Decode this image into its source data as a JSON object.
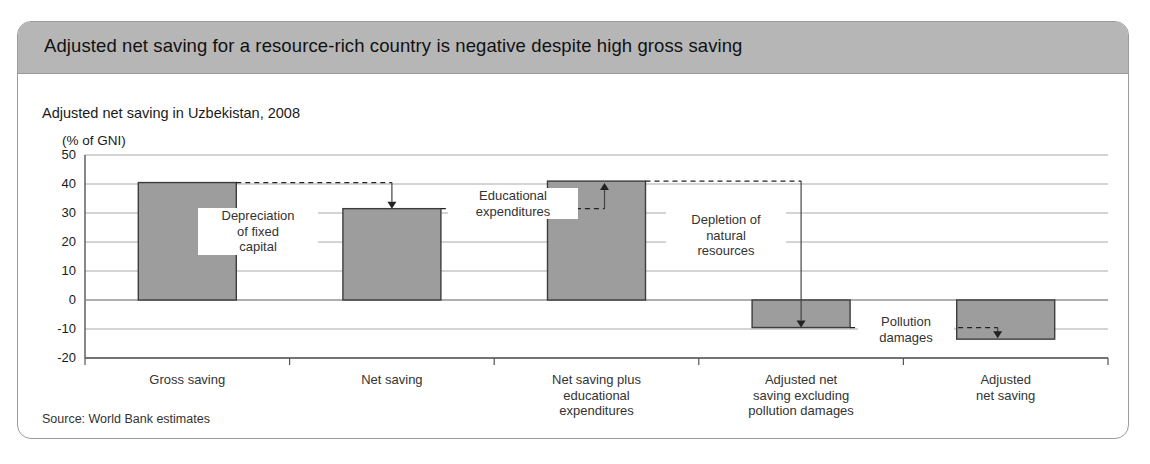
{
  "header": {
    "title": "Adjusted net saving for a resource-rich country is negative despite high gross saving"
  },
  "source": {
    "text": "Source: World Bank estimates"
  },
  "chart_data": {
    "type": "bar",
    "title": "Adjusted net saving in Uzbekistan, 2008",
    "unit_label": "(% of GNI)",
    "xlabel": "",
    "ylabel": "(% of GNI)",
    "ylim": [
      -20,
      50
    ],
    "yticks": [
      50,
      40,
      30,
      20,
      10,
      0,
      -10,
      -20
    ],
    "ytick_labels": [
      "50",
      "40",
      "30",
      "20",
      "10",
      "0",
      "-10",
      "-20"
    ],
    "grid": true,
    "legend": "none",
    "bar_color": "#9d9d9d",
    "bar_edge_color": "#3d3d3d",
    "categories": [
      "Gross saving",
      "Net saving",
      "Net saving plus\neducational\nexpenditures",
      "Adjusted net\nsaving excluding\npollution damages",
      "Adjusted\nnet saving"
    ],
    "values": [
      40.5,
      31.5,
      41.0,
      -9.5,
      -13.5
    ],
    "annotations": [
      {
        "label": "Depreciation\nof fixed\ncapital",
        "from_value": 40.5,
        "to_value": 31.5
      },
      {
        "label": "Educational\nexpenditures",
        "from_value": 31.5,
        "to_value": 41.0
      },
      {
        "label": "Depletion of\nnatural\nresources",
        "from_value": 41.0,
        "to_value": -9.5
      },
      {
        "label": "Pollution\ndamages",
        "from_value": -9.5,
        "to_value": -13.5
      }
    ]
  }
}
